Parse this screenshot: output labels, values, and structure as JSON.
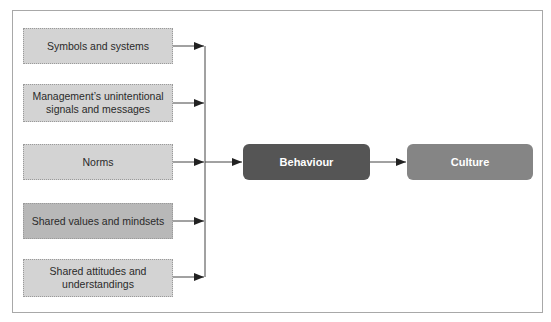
{
  "diagram": {
    "sources": [
      {
        "label": "Symbols and systems",
        "shade": "light"
      },
      {
        "label": "Management’s unintentional signals and messages",
        "shade": "light"
      },
      {
        "label": "Norms",
        "shade": "light"
      },
      {
        "label": "Shared values and mindsets",
        "shade": "dark"
      },
      {
        "label": "Shared attitudes and understandings",
        "shade": "light"
      }
    ],
    "behaviour": {
      "label": "Behaviour"
    },
    "culture": {
      "label": "Culture"
    },
    "colors": {
      "source_light": "#d3d3d3",
      "source_dark": "#b8b8b8",
      "behaviour": "#555555",
      "culture": "#858585",
      "frame": "#a8a8a8",
      "arrow": "#222222"
    }
  }
}
